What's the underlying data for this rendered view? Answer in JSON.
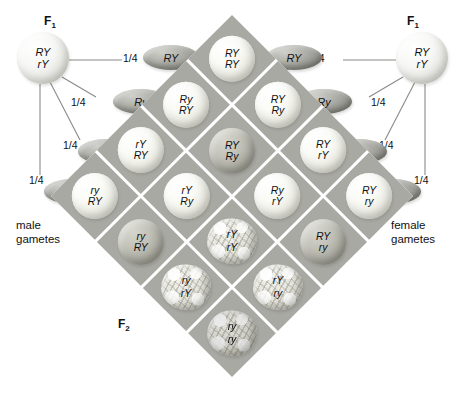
{
  "labels": {
    "f1_left": "F",
    "f1_left_sub": "1",
    "f1_right": "F",
    "f1_right_sub": "1",
    "f2": "F",
    "f2_sub": "2",
    "male_gametes": "male\ngametes",
    "male_gametes_line1": "male",
    "male_gametes_line2": "gametes",
    "female_gametes_line1": "female",
    "female_gametes_line2": "gametes"
  },
  "parents": {
    "left": {
      "allele_top": "RY",
      "allele_bottom": "rY",
      "name": "F1 male parent"
    },
    "right": {
      "allele_top": "RY",
      "allele_bottom": "rY",
      "name": "F1 female parent"
    }
  },
  "male_gametes": [
    {
      "label": "RY",
      "probability": "1/4"
    },
    {
      "label": "Ry",
      "probability": "1/4"
    },
    {
      "label": "rY",
      "probability": "1/4"
    },
    {
      "label": "ry",
      "probability": "1/4"
    }
  ],
  "female_gametes": [
    {
      "label": "RY",
      "probability": "1/4"
    },
    {
      "label": "Ry",
      "probability": "1/4"
    },
    {
      "label": "rY",
      "probability": "1/4"
    },
    {
      "label": "ry",
      "probability": "1/4"
    }
  ],
  "colors": {
    "grid_background": "#a9a9a4",
    "grid_gap": "#ffffff",
    "round_seed": "#f5f5ef",
    "shaded_seed": "#bdbdb4",
    "wrinkled_seed": "#dedad2",
    "gamete_ellipse": "#9a9a94",
    "connector_line": "#8a8a86",
    "text": "#111111"
  },
  "grid": {
    "rows": 4,
    "cols": 4,
    "row_gametes": [
      "RY",
      "Ry",
      "rY",
      "ry"
    ],
    "col_gametes": [
      "RY",
      "Ry",
      "rY",
      "ry"
    ],
    "cells": [
      {
        "r": 0,
        "c": 0,
        "g1": "RY",
        "g2": "RY",
        "seed": "round",
        "shaded": false
      },
      {
        "r": 0,
        "c": 1,
        "g1": "RY",
        "g2": "Ry",
        "seed": "round",
        "shaded": false
      },
      {
        "r": 0,
        "c": 2,
        "g1": "RY",
        "g2": "rY",
        "seed": "round",
        "shaded": false
      },
      {
        "r": 0,
        "c": 3,
        "g1": "RY",
        "g2": "ry",
        "seed": "round",
        "shaded": false
      },
      {
        "r": 1,
        "c": 0,
        "g1": "Ry",
        "g2": "RY",
        "seed": "round",
        "shaded": false
      },
      {
        "r": 1,
        "c": 1,
        "g1": "RY",
        "g2": "Ry",
        "seed": "round",
        "shaded": true
      },
      {
        "r": 1,
        "c": 2,
        "g1": "Ry",
        "g2": "rY",
        "seed": "round",
        "shaded": false
      },
      {
        "r": 1,
        "c": 3,
        "g1": "RY",
        "g2": "ry",
        "seed": "round",
        "shaded": true
      },
      {
        "r": 2,
        "c": 0,
        "g1": "rY",
        "g2": "RY",
        "seed": "round",
        "shaded": false
      },
      {
        "r": 2,
        "c": 1,
        "g1": "rY",
        "g2": "Ry",
        "seed": "round",
        "shaded": false
      },
      {
        "r": 2,
        "c": 2,
        "g1": "rY",
        "g2": "rY",
        "seed": "wrinkled",
        "shaded": false
      },
      {
        "r": 2,
        "c": 3,
        "g1": "rY",
        "g2": "ry",
        "seed": "wrinkled",
        "shaded": false
      },
      {
        "r": 3,
        "c": 0,
        "g1": "ry",
        "g2": "RY",
        "seed": "round",
        "shaded": false
      },
      {
        "r": 3,
        "c": 1,
        "g1": "ry",
        "g2": "RY",
        "seed": "round",
        "shaded": true
      },
      {
        "r": 3,
        "c": 2,
        "g1": "ry",
        "g2": "rY",
        "seed": "wrinkled",
        "shaded": false
      },
      {
        "r": 3,
        "c": 3,
        "g1": "ry",
        "g2": "ry",
        "seed": "wrinkled",
        "shaded": true
      }
    ]
  }
}
